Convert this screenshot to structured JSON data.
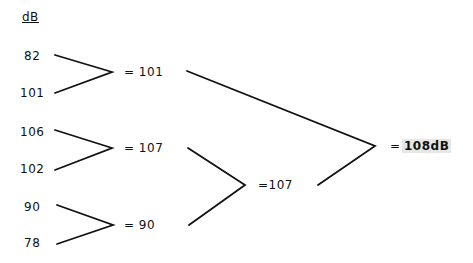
{
  "unit_label": "dB",
  "inputs": [
    "82",
    "101",
    "106",
    "102",
    "90",
    "78"
  ],
  "level1": [
    "= 101",
    "= 107",
    "= 90"
  ],
  "level2": [
    "=107"
  ],
  "result": {
    "eq": "=",
    "value": "108dB"
  }
}
